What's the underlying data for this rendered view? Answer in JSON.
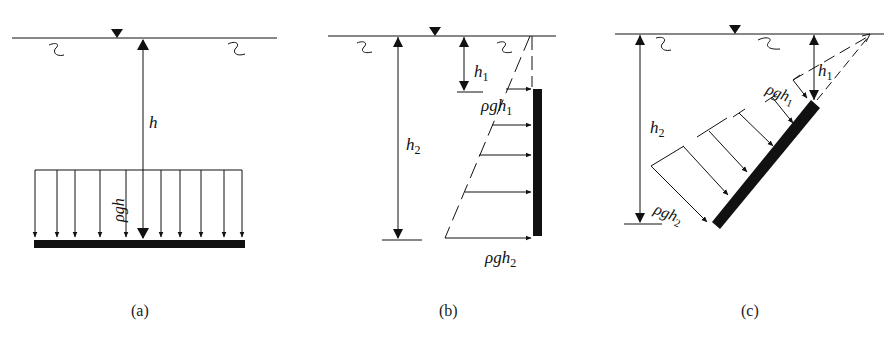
{
  "figure": {
    "panels": [
      {
        "id": "a",
        "caption": "(a)",
        "labels": {
          "depth": "h",
          "pressure": "ρgh"
        },
        "description": "Horizontal plate at depth h with uniform pressure distribution ρgh"
      },
      {
        "id": "b",
        "caption": "(b)",
        "labels": {
          "depth_top": "h",
          "depth_top_sub": "1",
          "depth_bottom": "h",
          "depth_bottom_sub": "2",
          "pressure_top": "ρgh",
          "pressure_top_sub": "1",
          "pressure_bottom": "ρgh",
          "pressure_bottom_sub": "2"
        },
        "description": "Vertical plate from depth h1 to h2 with linearly increasing pressure"
      },
      {
        "id": "c",
        "caption": "(c)",
        "labels": {
          "depth_top": "h",
          "depth_top_sub": "1",
          "depth_bottom": "h",
          "depth_bottom_sub": "2",
          "pressure_top": "ρgh",
          "pressure_top_sub": "1",
          "pressure_bottom": "ρgh",
          "pressure_bottom_sub": "2"
        },
        "description": "Inclined plate from depth h1 to h2 with pressure normal to the surface"
      }
    ],
    "colors": {
      "ink": "#111111",
      "background": "#ffffff"
    }
  }
}
